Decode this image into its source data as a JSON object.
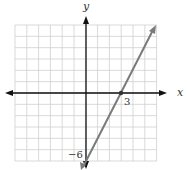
{
  "chart_data": {
    "type": "line",
    "title": "",
    "xlabel": "x",
    "ylabel": "y",
    "grid": true,
    "xlim": [
      -6,
      6
    ],
    "ylim": [
      -6,
      6
    ],
    "series": [
      {
        "name": "y = 2x - 6",
        "equation": "y = 2x - 6",
        "x": [
          0,
          3,
          6
        ],
        "y": [
          -6,
          0,
          6
        ],
        "color": "#7a7a7a"
      }
    ],
    "annotations": [
      {
        "text": "3",
        "x": 3,
        "y": 0,
        "note": "x-intercept"
      },
      {
        "text": "-6",
        "x": 0,
        "y": -6,
        "note": "y-intercept"
      }
    ]
  },
  "labels": {
    "x_axis": "x",
    "y_axis": "y",
    "x_intercept": "3",
    "y_intercept": "−6"
  },
  "colors": {
    "grid": "#cfcfcf",
    "axis": "#111111",
    "line": "#7a7a7a"
  }
}
